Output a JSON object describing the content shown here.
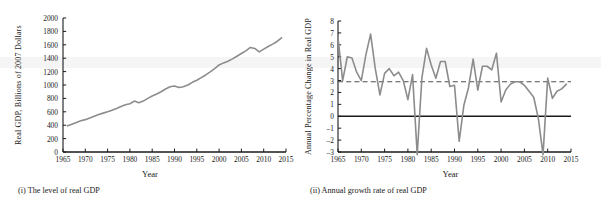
{
  "figure": {
    "panels": [
      {
        "id": "level-of-real-gdp",
        "caption": "(i) The level of real GDP",
        "chart_data": {
          "type": "line",
          "title": "",
          "xlabel": "Year",
          "ylabel": "Real GDP, Billions of 2007 Dollars",
          "xlim": [
            1965,
            2015
          ],
          "ylim": [
            0,
            2000
          ],
          "xticks": [
            1965,
            1970,
            1975,
            1980,
            1985,
            1990,
            1995,
            2000,
            2005,
            2010,
            2015
          ],
          "yticks": [
            0,
            200,
            400,
            600,
            800,
            1000,
            1200,
            1400,
            1600,
            1800,
            2000
          ],
          "grid": false,
          "legend": "none",
          "series": [
            {
              "name": "Real GDP",
              "color": "#8c8c8c",
              "x": [
                1966,
                1967,
                1968,
                1969,
                1970,
                1971,
                1972,
                1973,
                1974,
                1975,
                1976,
                1977,
                1978,
                1979,
                1980,
                1981,
                1982,
                1983,
                1984,
                1985,
                1986,
                1987,
                1988,
                1989,
                1990,
                1991,
                1992,
                1993,
                1994,
                1995,
                1996,
                1997,
                1998,
                1999,
                2000,
                2001,
                2002,
                2003,
                2004,
                2005,
                2006,
                2007,
                2008,
                2009,
                2010,
                2011,
                2012,
                2013,
                2014
              ],
              "values": [
                390,
                416,
                440,
                466,
                483,
                508,
                535,
                560,
                580,
                600,
                625,
                650,
                680,
                705,
                720,
                760,
                735,
                760,
                800,
                835,
                865,
                900,
                940,
                975,
                985,
                962,
                975,
                1000,
                1040,
                1070,
                1110,
                1150,
                1195,
                1245,
                1300,
                1330,
                1355,
                1390,
                1430,
                1470,
                1510,
                1560,
                1545,
                1495,
                1535,
                1575,
                1610,
                1650,
                1705
              ]
            }
          ]
        }
      },
      {
        "id": "annual-growth-rate-of-real-gdp",
        "caption": "(ii) Annual growth rate of real GDP",
        "chart_data": {
          "type": "line",
          "title": "",
          "xlabel": "Year",
          "ylabel": "Annual Percentage Change in Real GDP",
          "xlim": [
            1965,
            2015
          ],
          "ylim": [
            -3,
            8
          ],
          "xticks": [
            1965,
            1970,
            1975,
            1980,
            1985,
            1990,
            1995,
            2000,
            2005,
            2010,
            2015
          ],
          "yticks": [
            -3,
            -2,
            -1,
            0,
            1,
            2,
            3,
            4,
            5,
            6,
            7,
            8
          ],
          "grid": false,
          "legend": "none",
          "reference_lines": [
            {
              "name": "zero-line",
              "value": 0,
              "style": "solid",
              "color": "#1a1a1a"
            },
            {
              "name": "average-growth-line",
              "value": 2.9,
              "style": "dashed",
              "color": "#4d4d4d"
            }
          ],
          "series": [
            {
              "name": "Annual percentage change in real GDP",
              "color": "#8c8c8c",
              "x": [
                1965,
                1966,
                1967,
                1968,
                1969,
                1970,
                1971,
                1972,
                1973,
                1974,
                1975,
                1976,
                1977,
                1978,
                1979,
                1980,
                1981,
                1982,
                1983,
                1984,
                1985,
                1986,
                1987,
                1988,
                1989,
                1990,
                1991,
                1992,
                1993,
                1994,
                1995,
                1996,
                1997,
                1998,
                1999,
                2000,
                2001,
                2002,
                2003,
                2004,
                2005,
                2006,
                2007,
                2008,
                2009,
                2010,
                2011,
                2012,
                2013,
                2014
              ],
              "values": [
                6.6,
                3.0,
                5.0,
                4.9,
                3.7,
                3.0,
                5.2,
                6.9,
                4.0,
                1.8,
                3.6,
                4.0,
                3.4,
                3.7,
                3.0,
                1.4,
                3.5,
                -3.2,
                3.2,
                5.7,
                4.3,
                3.2,
                4.6,
                4.6,
                2.5,
                2.6,
                -2.1,
                0.9,
                2.4,
                4.8,
                2.2,
                4.2,
                4.2,
                3.9,
                5.3,
                1.2,
                2.2,
                2.7,
                2.9,
                2.9,
                2.6,
                2.1,
                1.6,
                -0.2,
                -3.1,
                3.2,
                1.5,
                2.1,
                2.3,
                2.7
              ]
            }
          ]
        }
      }
    ]
  }
}
